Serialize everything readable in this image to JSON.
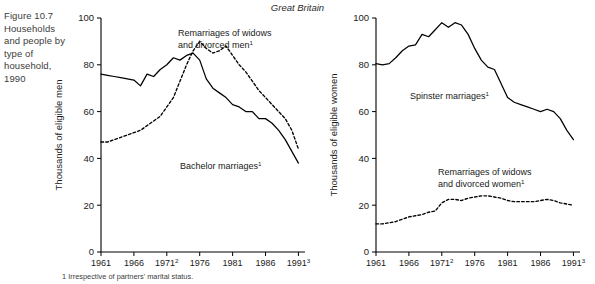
{
  "figure": {
    "caption": "Figure 10.7 Households and people by type of household, 1990",
    "region_title": "Great Britain",
    "footnote": "1 Irrespective of partners' marital status."
  },
  "chart_data": [
    {
      "type": "line",
      "title": "Great Britain",
      "panel": "men",
      "xlabel": "",
      "ylabel": "Thousands of eligible men",
      "xlim": [
        1961,
        1992
      ],
      "ylim": [
        0,
        100
      ],
      "grid": false,
      "legend_position": "inline-annotation",
      "xticks": [
        "1961",
        "1966",
        "1971",
        "1976",
        "1981",
        "1986",
        "1991"
      ],
      "xtick_notes": {
        "1971": "2",
        "1991": "3"
      },
      "yticks": [
        0,
        20,
        40,
        60,
        80,
        100
      ],
      "x": [
        1961,
        1962,
        1963,
        1964,
        1965,
        1966,
        1967,
        1968,
        1969,
        1970,
        1971,
        1972,
        1973,
        1974,
        1975,
        1976,
        1977,
        1978,
        1979,
        1980,
        1981,
        1982,
        1983,
        1984,
        1985,
        1986,
        1987,
        1988,
        1989,
        1990,
        1991
      ],
      "series": [
        {
          "name": "Bachelor marriages",
          "style": "solid",
          "annotation": "Bachelor marriages",
          "values": [
            76,
            75.5,
            75,
            74.5,
            74,
            73.5,
            71,
            76,
            75,
            78,
            80,
            83,
            82,
            84,
            85,
            82,
            74,
            70,
            68,
            66,
            63,
            62,
            60,
            60,
            57,
            57,
            55,
            52,
            48,
            43,
            38
          ]
        },
        {
          "name": "Remarriages of widows and divorced men",
          "style": "dashed",
          "annotation": "Remarriages of widows and divorced men",
          "values": [
            47,
            47,
            48,
            49,
            50,
            51,
            52,
            54,
            56,
            58,
            62,
            66,
            73,
            80,
            86,
            90,
            87,
            85,
            86,
            88,
            84,
            80,
            77,
            73,
            69,
            66,
            63,
            60,
            57,
            52,
            44
          ]
        }
      ]
    },
    {
      "type": "line",
      "title": "Great Britain",
      "panel": "women",
      "xlabel": "",
      "ylabel": "Thousands of eligible women",
      "xlim": [
        1961,
        1992
      ],
      "ylim": [
        0,
        100
      ],
      "grid": false,
      "legend_position": "inline-annotation",
      "xticks": [
        "1961",
        "1966",
        "1971",
        "1976",
        "1981",
        "1986",
        "1991"
      ],
      "xtick_notes": {
        "1971": "2",
        "1991": "3"
      },
      "yticks": [
        0,
        20,
        40,
        60,
        80,
        100
      ],
      "x": [
        1961,
        1962,
        1963,
        1964,
        1965,
        1966,
        1967,
        1968,
        1969,
        1970,
        1971,
        1972,
        1973,
        1974,
        1975,
        1976,
        1977,
        1978,
        1979,
        1980,
        1981,
        1982,
        1983,
        1984,
        1985,
        1986,
        1987,
        1988,
        1989,
        1990,
        1991
      ],
      "series": [
        {
          "name": "Spinster marriages",
          "style": "solid",
          "annotation": "Spinster marriages",
          "values": [
            80.5,
            80,
            80.5,
            83,
            86,
            88,
            88.5,
            93,
            92,
            95,
            98,
            96,
            98,
            97,
            93,
            87,
            82,
            79,
            78,
            72,
            66,
            64,
            63,
            62,
            61,
            60,
            61,
            60,
            57,
            52,
            48
          ]
        },
        {
          "name": "Remarriages of widows and divorced women",
          "style": "dashed",
          "annotation": "Remarriages of widows and divorced women",
          "values": [
            12,
            12,
            12.5,
            13,
            14,
            15,
            15.5,
            16,
            17,
            17.5,
            21,
            22.5,
            22.5,
            22,
            23,
            23.5,
            24,
            24,
            23.5,
            23,
            22,
            21.5,
            21.5,
            21.5,
            21.5,
            22,
            22.5,
            22,
            21,
            20.5,
            20
          ]
        }
      ]
    }
  ]
}
